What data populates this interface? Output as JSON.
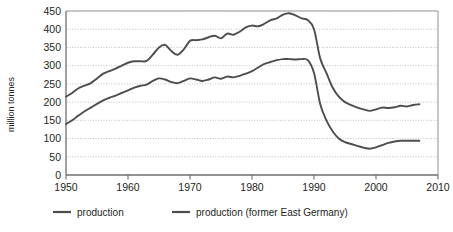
{
  "chart_data": {
    "type": "line",
    "title": "",
    "xlabel": "",
    "ylabel": "million tonnes",
    "xlim": [
      1950,
      2010
    ],
    "ylim": [
      0,
      450
    ],
    "xticks": [
      1950,
      1960,
      1970,
      1980,
      1990,
      2000,
      2010
    ],
    "yticks": [
      0,
      50,
      100,
      150,
      200,
      250,
      300,
      350,
      400,
      450
    ],
    "grid": "horizontal-dotted",
    "legend_position": "below",
    "series": [
      {
        "name": "production",
        "color": "#4d4d4d",
        "x": [
          1950,
          1951,
          1952,
          1953,
          1954,
          1955,
          1956,
          1957,
          1958,
          1959,
          1960,
          1961,
          1962,
          1963,
          1964,
          1965,
          1966,
          1967,
          1968,
          1969,
          1970,
          1971,
          1972,
          1973,
          1974,
          1975,
          1976,
          1977,
          1978,
          1979,
          1980,
          1981,
          1982,
          1983,
          1984,
          1985,
          1986,
          1987,
          1988,
          1989,
          1990,
          1991,
          1992,
          1993,
          1994,
          1995,
          1996,
          1997,
          1998,
          1999,
          2000,
          2001,
          2002,
          2003,
          2004,
          2005,
          2006,
          2007
        ],
        "values": [
          215,
          225,
          238,
          245,
          252,
          265,
          278,
          285,
          292,
          300,
          308,
          312,
          312,
          313,
          330,
          350,
          357,
          340,
          330,
          345,
          368,
          370,
          372,
          378,
          382,
          375,
          388,
          385,
          393,
          405,
          410,
          408,
          415,
          425,
          430,
          440,
          444,
          438,
          430,
          425,
          400,
          320,
          280,
          240,
          215,
          200,
          192,
          185,
          180,
          176,
          180,
          185,
          184,
          186,
          190,
          188,
          192,
          194
        ]
      },
      {
        "name": "production (former East Germany)",
        "color": "#4d4d4d",
        "x": [
          1950,
          1951,
          1952,
          1953,
          1954,
          1955,
          1956,
          1957,
          1958,
          1959,
          1960,
          1961,
          1962,
          1963,
          1964,
          1965,
          1966,
          1967,
          1968,
          1969,
          1970,
          1971,
          1972,
          1973,
          1974,
          1975,
          1976,
          1977,
          1978,
          1979,
          1980,
          1981,
          1982,
          1983,
          1984,
          1985,
          1986,
          1987,
          1988,
          1989,
          1990,
          1991,
          1992,
          1993,
          1994,
          1995,
          1996,
          1997,
          1998,
          1999,
          2000,
          2001,
          2002,
          2003,
          2004,
          2005,
          2006,
          2007
        ],
        "values": [
          140,
          150,
          163,
          175,
          185,
          195,
          205,
          212,
          218,
          225,
          232,
          240,
          245,
          248,
          258,
          265,
          262,
          255,
          252,
          258,
          265,
          262,
          258,
          262,
          268,
          264,
          270,
          268,
          272,
          278,
          285,
          295,
          305,
          310,
          315,
          318,
          318,
          317,
          318,
          315,
          280,
          195,
          150,
          120,
          100,
          90,
          85,
          80,
          75,
          72,
          76,
          82,
          88,
          92,
          94,
          94,
          94,
          94
        ]
      }
    ]
  },
  "axis": {
    "ylabel": "million tonnes",
    "yticks": [
      "450",
      "400",
      "350",
      "300",
      "250",
      "200",
      "150",
      "100",
      "50",
      "0"
    ],
    "xticks": [
      "1950",
      "1960",
      "1970",
      "1980",
      "1990",
      "2000",
      "2010"
    ]
  },
  "legend": {
    "items": [
      {
        "label": "production"
      },
      {
        "label": "production (former East Germany)"
      }
    ]
  },
  "colors": {
    "line": "#4d4d4d",
    "axis": "#6e6e6e",
    "grid": "#b3b3b3",
    "text": "#231f20"
  }
}
